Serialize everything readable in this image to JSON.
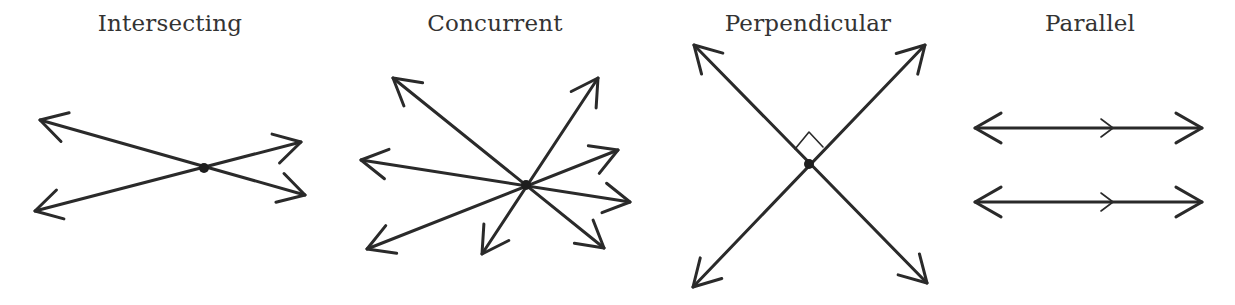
{
  "diagrams": [
    {
      "label": "Intersecting",
      "label_x": 170,
      "lines": [
        {
          "x1": 40,
          "y1": 120,
          "x2": 305,
          "y2": 195
        },
        {
          "x1": 35,
          "y1": 211,
          "x2": 301,
          "y2": 142
        }
      ],
      "point": {
        "x": 204,
        "y": 168
      }
    },
    {
      "label": "Concurrent",
      "label_x": 495,
      "lines": [
        {
          "x1": 393,
          "y1": 78,
          "x2": 604,
          "y2": 248
        },
        {
          "x1": 598,
          "y1": 78,
          "x2": 482,
          "y2": 254
        },
        {
          "x1": 361,
          "y1": 160,
          "x2": 630,
          "y2": 202
        },
        {
          "x1": 367,
          "y1": 249,
          "x2": 618,
          "y2": 150
        }
      ],
      "point": {
        "x": 526,
        "y": 185
      }
    },
    {
      "label": "Perpendicular",
      "label_x": 808,
      "lines": [
        {
          "x1": 694,
          "y1": 45,
          "x2": 927,
          "y2": 283
        },
        {
          "x1": 925,
          "y1": 45,
          "x2": 693,
          "y2": 287
        }
      ],
      "point": {
        "x": 809,
        "y": 164
      },
      "right_angle_marker": {
        "points": "795,149 809,132 823,147"
      }
    },
    {
      "label": "Parallel",
      "label_x": 1090,
      "lines": [
        {
          "x1": 975,
          "y1": 128,
          "x2": 1202,
          "y2": 128
        },
        {
          "x1": 975,
          "y1": 202,
          "x2": 1202,
          "y2": 202
        }
      ],
      "parallel_ticks_x": 1113
    }
  ],
  "colors": {
    "stroke": "#2a2a2a",
    "text": "#333333",
    "background": "#ffffff"
  }
}
